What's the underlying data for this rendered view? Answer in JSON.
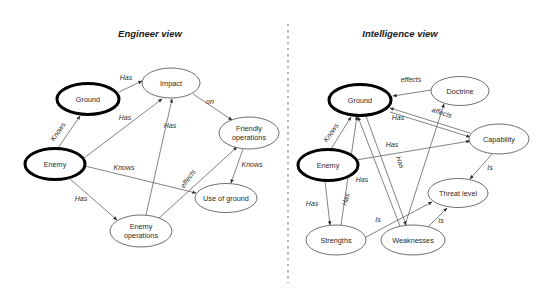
{
  "figure": {
    "type": "concept-map-diagram",
    "background_color": "#ffffff",
    "panels": [
      {
        "id": "engineer",
        "title": "Engineer view"
      },
      {
        "id": "intelligence",
        "title": "Intelligence view"
      }
    ],
    "divider": {
      "style": "dashed",
      "color": "#8a8a8a",
      "x": 288,
      "y1": 24,
      "y2": 283
    }
  },
  "engineer_view": {
    "title": "Engineer view",
    "title_pos": {
      "x": 150,
      "y": 37
    },
    "nodes": [
      {
        "id": "eng-ground",
        "label": "Ground",
        "cx": 88,
        "cy": 99,
        "rx": 31,
        "ry": 15.5,
        "emphasis": true,
        "lines": [
          "Ground"
        ]
      },
      {
        "id": "eng-impact",
        "label": "Impact",
        "cx": 171,
        "cy": 83,
        "rx": 29,
        "ry": 15,
        "emphasis": false,
        "lines": [
          "Impact"
        ]
      },
      {
        "id": "eng-enemy",
        "label": "Enemy",
        "cx": 55,
        "cy": 164,
        "rx": 30,
        "ry": 15.5,
        "emphasis": true,
        "lines": [
          "Enemy"
        ]
      },
      {
        "id": "eng-friendly",
        "label": "Friendly operations",
        "cx": 249,
        "cy": 133,
        "rx": 30,
        "ry": 16,
        "emphasis": false,
        "lines": [
          "Friendly",
          "operations"
        ]
      },
      {
        "id": "eng-useground",
        "label": "Use of ground",
        "cx": 226,
        "cy": 198,
        "rx": 31,
        "ry": 14.5,
        "emphasis": false,
        "lines": [
          "Use of ground"
        ]
      },
      {
        "id": "eng-enemyops",
        "label": "Enemy operations",
        "cx": 141,
        "cy": 231,
        "rx": 31,
        "ry": 16,
        "emphasis": false,
        "lines": [
          "Enemy",
          "operations"
        ]
      }
    ],
    "edges": [
      {
        "id": "e1",
        "from": "eng-ground",
        "to": "eng-impact",
        "label": "Has",
        "x1": 119,
        "y1": 92,
        "x2": 142,
        "y2": 81,
        "lx": 126,
        "ly": 80,
        "rot": 0,
        "arrow": "end"
      },
      {
        "id": "e2",
        "from": "eng-enemy",
        "to": "eng-ground",
        "label": "Knows",
        "x1": 58,
        "y1": 148,
        "x2": 80,
        "y2": 116,
        "lx": 60,
        "ly": 133,
        "rot": -56,
        "arrow": "both"
      },
      {
        "id": "e3",
        "from": "eng-enemy",
        "to": "eng-impact",
        "label": "Has",
        "x1": 84,
        "y1": 158,
        "x2": 162,
        "y2": 99,
        "lx": 125,
        "ly": 120,
        "rot": 0,
        "arrow": "end"
      },
      {
        "id": "e4",
        "from": "eng-enemyops",
        "to": "eng-impact",
        "label": "Has",
        "x1": 146,
        "y1": 215,
        "x2": 172,
        "y2": 99,
        "lx": 170,
        "ly": 128,
        "rot": 0,
        "arrow": "both"
      },
      {
        "id": "e5",
        "from": "eng-impact",
        "to": "eng-friendly",
        "label": "on",
        "x1": 193,
        "y1": 94,
        "x2": 232,
        "y2": 120,
        "lx": 210,
        "ly": 104,
        "rot": 0,
        "arrow": "end"
      },
      {
        "id": "e6",
        "from": "eng-enemy",
        "to": "eng-useground",
        "label": "Knows",
        "x1": 85,
        "y1": 166,
        "x2": 196,
        "y2": 193,
        "lx": 124,
        "ly": 170,
        "rot": 0,
        "arrow": "end"
      },
      {
        "id": "e7",
        "from": "eng-enemy",
        "to": "eng-enemyops",
        "label": "Has",
        "x1": 69,
        "y1": 178,
        "x2": 117,
        "y2": 220,
        "lx": 81,
        "ly": 201,
        "rot": 0,
        "arrow": "end"
      },
      {
        "id": "e8",
        "from": "eng-enemyops",
        "to": "eng-friendly",
        "label": "effects",
        "x1": 158,
        "y1": 219,
        "x2": 237,
        "y2": 147,
        "lx": 190,
        "ly": 180,
        "rot": -55,
        "arrow": "end"
      },
      {
        "id": "e9",
        "from": "eng-friendly",
        "to": "eng-useground",
        "label": "Knows",
        "x1": 243,
        "y1": 149,
        "x2": 231,
        "y2": 183,
        "lx": 252,
        "ly": 167,
        "rot": 0,
        "arrow": "end"
      }
    ]
  },
  "intelligence_view": {
    "title": "Intelligence view",
    "title_pos": {
      "x": 400,
      "y": 37
    },
    "nodes": [
      {
        "id": "int-ground",
        "label": "Ground",
        "cx": 360,
        "cy": 100,
        "rx": 31,
        "ry": 15.5,
        "emphasis": true,
        "lines": [
          "Ground"
        ]
      },
      {
        "id": "int-doctrine",
        "label": "Doctrine",
        "cx": 460,
        "cy": 91,
        "rx": 29,
        "ry": 14.5,
        "emphasis": false,
        "lines": [
          "Doctrine"
        ]
      },
      {
        "id": "int-capability",
        "label": "Capability",
        "cx": 499,
        "cy": 139,
        "rx": 30,
        "ry": 15,
        "emphasis": false,
        "lines": [
          "Capability"
        ]
      },
      {
        "id": "int-enemy",
        "label": "Enemy",
        "cx": 328,
        "cy": 165,
        "rx": 30,
        "ry": 15.5,
        "emphasis": true,
        "lines": [
          "Enemy"
        ]
      },
      {
        "id": "int-threat",
        "label": "Threat level",
        "cx": 458,
        "cy": 193,
        "rx": 30,
        "ry": 14.5,
        "emphasis": false,
        "lines": [
          "Threat level"
        ]
      },
      {
        "id": "int-strengths",
        "label": "Strengths",
        "cx": 336,
        "cy": 240,
        "rx": 30,
        "ry": 15,
        "emphasis": false,
        "lines": [
          "Strengths"
        ]
      },
      {
        "id": "int-weaknesses",
        "label": "Weaknesses",
        "cx": 413,
        "cy": 240,
        "rx": 32,
        "ry": 15,
        "emphasis": false,
        "lines": [
          "Weaknesses"
        ]
      }
    ],
    "edges": [
      {
        "id": "i1",
        "from": "int-doctrine",
        "to": "int-ground",
        "label": "effects",
        "x1": 431,
        "y1": 90,
        "x2": 393,
        "y2": 96,
        "lx": 411,
        "ly": 82,
        "rot": 0,
        "arrow": "end"
      },
      {
        "id": "i2",
        "from": "int-enemy",
        "to": "int-ground",
        "label": "Knows",
        "x1": 331,
        "y1": 149,
        "x2": 351,
        "y2": 117,
        "lx": 333,
        "ly": 134,
        "rot": -56,
        "arrow": "both"
      },
      {
        "id": "i3",
        "from": "int-capability",
        "to": "int-ground",
        "label": "Has",
        "x1": 470,
        "y1": 133,
        "x2": 390,
        "y2": 108,
        "lx": 398,
        "ly": 120,
        "rot": 0,
        "arrow": "end"
      },
      {
        "id": "i4",
        "from": "int-ground",
        "to": "int-capability",
        "label": "affects",
        "x1": 390,
        "y1": 112,
        "x2": 470,
        "y2": 137,
        "lx": 441,
        "ly": 115,
        "rot": 18,
        "arrow": "end"
      },
      {
        "id": "i5",
        "from": "int-weaknesses",
        "to": "int-doctrine",
        "label": "",
        "x1": 405,
        "y1": 225,
        "x2": 444,
        "y2": 104,
        "lx": 0,
        "ly": 0,
        "rot": 0,
        "arrow": "end"
      },
      {
        "id": "i6",
        "from": "int-enemy",
        "to": "int-capability",
        "label": "Has",
        "x1": 356,
        "y1": 160,
        "x2": 470,
        "y2": 141,
        "lx": 392,
        "ly": 147,
        "rot": 0,
        "arrow": "end"
      },
      {
        "id": "i7",
        "from": "int-enemy",
        "to": "int-strengths",
        "label": "Has",
        "x1": 325,
        "y1": 181,
        "x2": 330,
        "y2": 225,
        "lx": 312,
        "ly": 206,
        "rot": 0,
        "arrow": "end"
      },
      {
        "id": "i8",
        "from": "int-strengths",
        "to": "int-ground",
        "label": "Has",
        "x1": 341,
        "y1": 225,
        "x2": 357,
        "y2": 116,
        "lx": 348,
        "ly": 200,
        "rot": -74,
        "arrow": "end"
      },
      {
        "id": "i9",
        "from": "int-ground",
        "to": "int-weaknesses",
        "label": "Has",
        "x1": 366,
        "y1": 116,
        "x2": 406,
        "y2": 225,
        "lx": 398,
        "ly": 163,
        "rot": 70,
        "arrow": "both"
      },
      {
        "id": "i10",
        "from": "int-weaknesses",
        "to": "int-ground",
        "label": "Has",
        "x1": 400,
        "y1": 226,
        "x2": 358,
        "y2": 117,
        "lx": 362,
        "ly": 182,
        "rot": 0,
        "arrow": "end"
      },
      {
        "id": "i11",
        "from": "int-strengths",
        "to": "int-threat",
        "label": "Is",
        "x1": 366,
        "y1": 237,
        "x2": 432,
        "y2": 202,
        "lx": 378,
        "ly": 222,
        "rot": 0,
        "arrow": "end"
      },
      {
        "id": "i12",
        "from": "int-weaknesses",
        "to": "int-threat",
        "label": "Is",
        "x1": 428,
        "y1": 227,
        "x2": 447,
        "y2": 208,
        "lx": 441,
        "ly": 223,
        "rot": 0,
        "arrow": "end"
      },
      {
        "id": "i13",
        "from": "int-capability",
        "to": "int-threat",
        "label": "Is",
        "x1": 492,
        "y1": 154,
        "x2": 470,
        "y2": 179,
        "lx": 490,
        "ly": 170,
        "rot": 0,
        "arrow": "end"
      }
    ]
  }
}
